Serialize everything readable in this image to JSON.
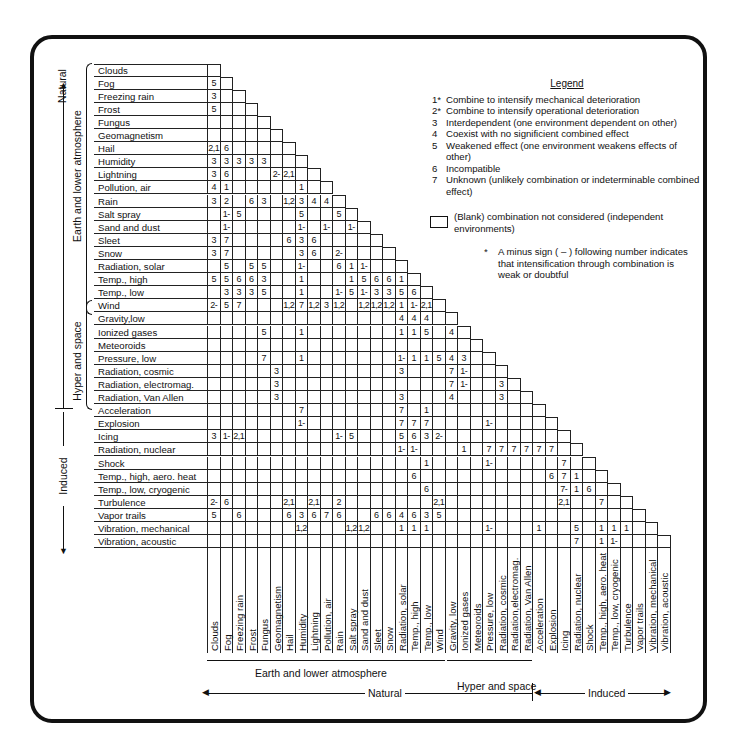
{
  "legend": {
    "title": "Legend",
    "items": [
      {
        "code": "1*",
        "text": "Combine to intensify mechanical deterioration"
      },
      {
        "code": "2*",
        "text": "Combine to intensify operational deterioration"
      },
      {
        "code": "3",
        "text": "Interdependent (one environment dependent on other)"
      },
      {
        "code": "4",
        "text": "Coexist with no significient combined effect"
      },
      {
        "code": "5",
        "text": "Weakened effect (one environment weakens effects of other)"
      },
      {
        "code": "6",
        "text": "Incompatible"
      },
      {
        "code": "7",
        "text": "Unknown (unlikely combination or indeterminable combined effect)"
      }
    ],
    "blank": "(Blank) combination not considered (independent environments)",
    "note_star": "*",
    "note": "A minus sign ( – ) following number indicates that intensification through combination is weak or doubtful"
  },
  "groups": {
    "natural": "Natural",
    "earth": "Earth and lower atmosphere",
    "hyper": "Hyper and space",
    "induced": "Induced"
  },
  "environments": [
    "Clouds",
    "Fog",
    "Freezing rain",
    "Frost",
    "Fungus",
    "Geomagnetism",
    "Hail",
    "Humidity",
    "Lightning",
    "Pollution, air",
    "Rain",
    "Salt spray",
    "Sand and dust",
    "Sleet",
    "Snow",
    "Radiation, solar",
    "Temp., high",
    "Temp., low",
    "Wind",
    "Gravity,low",
    "Ionized gases",
    "Meteoroids",
    "Pressure, low",
    "Radiation, cosmic",
    "Radiation, electromag.",
    "Radiation, Van Allen",
    "Acceleration",
    "Explosion",
    "Icing",
    "Radiation, nuclear",
    "Shock",
    "Temp., high, aero. heat",
    "Temp., low, cryogenic",
    "Turbulence",
    "Vapor trails",
    "Vibration, mechanical",
    "Vibration, acoustic"
  ],
  "column_labels": [
    "Clouds",
    "Fog",
    "Freezing rain",
    "Frost",
    "Fungus",
    "Geomagnetism",
    "Hail",
    "Humidity",
    "Lightning",
    "Pollution, air",
    "Rain",
    "Salt spray",
    "Sand and dust",
    "Sleet",
    "Snow",
    "Radiation, solar",
    "Temp., high",
    "Temp., low",
    "Wind",
    "Gravity, low",
    "Ionized gases",
    "Meteoroids",
    "Pressure, low",
    "Radiation, cosmic",
    "Radiation,electromag.",
    "Radiation, Van Allen",
    "Acceleration",
    "Explosion",
    "Icing",
    "Radiation, nuclear",
    "Shock",
    "Temp., high, aero. heat",
    "Temp., low, cryogenic",
    "Turbulence",
    "Vapor trails",
    "Vibration, mechanical",
    "Vibration, acoustic"
  ],
  "matrix": [
    [],
    [
      "5"
    ],
    [
      "3",
      ""
    ],
    [
      "5",
      "",
      "",
      ""
    ],
    [
      "",
      "",
      "",
      "",
      ""
    ],
    [
      "",
      "",
      "",
      "",
      "",
      ""
    ],
    [
      "2,1",
      "6",
      "",
      "",
      "",
      ""
    ],
    [
      "3",
      "3",
      "3",
      "3",
      "3",
      "",
      ""
    ],
    [
      "3",
      "6",
      "",
      "",
      "",
      "2-",
      "2,1",
      ""
    ],
    [
      "4",
      "1",
      "",
      "",
      "",
      "",
      "",
      "1",
      ""
    ],
    [
      "3",
      "2",
      "",
      "6",
      "3",
      "",
      "1,2",
      "3",
      "4",
      "4"
    ],
    [
      "",
      "1-",
      "5",
      "",
      "",
      "",
      "",
      "5",
      "",
      "",
      "5"
    ],
    [
      "",
      "1-",
      "",
      "",
      "",
      "",
      "",
      "1-",
      "",
      "1-",
      "",
      "1-"
    ],
    [
      "3",
      "7",
      "",
      "",
      "",
      "",
      "6",
      "3",
      "6",
      "",
      "",
      "",
      ""
    ],
    [
      "3",
      "7",
      "",
      "",
      "",
      "",
      "",
      "3",
      "6",
      "",
      "2-",
      "",
      ""
    ],
    [
      "",
      "5",
      "",
      "5",
      "5",
      "",
      "",
      "1-",
      "",
      "",
      "6",
      "1",
      "1-",
      "",
      ""
    ],
    [
      "5",
      "5",
      "6",
      "6",
      "3",
      "",
      "",
      "1",
      "",
      "",
      "",
      "1",
      "5",
      "6",
      "6",
      "1"
    ],
    [
      "",
      "3",
      "3",
      "3",
      "5",
      "",
      "",
      "1",
      "",
      "",
      "1-",
      "5",
      "1-",
      "3",
      "3",
      "5",
      "6"
    ],
    [
      "2-",
      "5",
      "7",
      "",
      "",
      "",
      "1,2",
      "7",
      "1,2",
      "3",
      "1,2",
      "",
      "1,2",
      "1,2",
      "1,2",
      "1",
      "1-",
      "2,1"
    ],
    [
      "",
      "",
      "",
      "",
      "",
      "",
      "",
      "",
      "",
      "",
      "",
      "",
      "",
      "",
      "",
      "4",
      "4",
      "4",
      ""
    ],
    [
      "",
      "",
      "",
      "",
      "5",
      "",
      "",
      "1",
      "",
      "",
      "",
      "",
      "",
      "",
      "",
      "1",
      "1",
      "5",
      "",
      "4"
    ],
    [
      "",
      "",
      "",
      "",
      "",
      "",
      "",
      "",
      "",
      "",
      "",
      "",
      "",
      "",
      "",
      "",
      "",
      "",
      "",
      "",
      ""
    ],
    [
      "",
      "",
      "",
      "",
      "7",
      "",
      "",
      "1",
      "",
      "",
      "",
      "",
      "",
      "",
      "",
      "1-",
      "1",
      "1",
      "5",
      "4",
      "3",
      ""
    ],
    [
      "",
      "",
      "",
      "",
      "",
      "3",
      "",
      "",
      "",
      "",
      "",
      "",
      "",
      "",
      "",
      "3",
      "",
      "",
      "",
      "7",
      "1-",
      "",
      ""
    ],
    [
      "",
      "",
      "",
      "",
      "",
      "3",
      "",
      "",
      "",
      "",
      "",
      "",
      "",
      "",
      "",
      "",
      "",
      "",
      "",
      "7",
      "1-",
      "",
      "",
      "3"
    ],
    [
      "",
      "",
      "",
      "",
      "",
      "3",
      "",
      "",
      "",
      "",
      "",
      "",
      "",
      "",
      "",
      "3",
      "",
      "",
      "",
      "4",
      "",
      "",
      "",
      "3",
      ""
    ],
    [
      "",
      "",
      "",
      "",
      "",
      "",
      "",
      "7",
      "",
      "",
      "",
      "",
      "",
      "",
      "",
      "7",
      "",
      "1",
      "",
      "",
      "",
      "",
      "",
      "",
      "",
      ""
    ],
    [
      "",
      "",
      "",
      "",
      "",
      "",
      "",
      "1-",
      "",
      "",
      "",
      "",
      "",
      "",
      "",
      "7",
      "7",
      "7",
      "",
      "",
      "",
      "",
      "1-",
      "",
      "",
      "",
      ""
    ],
    [
      "3",
      "1-",
      "2,1",
      "",
      "",
      "",
      "",
      "",
      "",
      "",
      "1-",
      "5",
      "",
      "",
      "",
      "5",
      "6",
      "3",
      "2-",
      "",
      "",
      "",
      "",
      "",
      "",
      "",
      "",
      ""
    ],
    [
      "",
      "",
      "",
      "",
      "",
      "",
      "",
      "",
      "",
      "",
      "",
      "",
      "",
      "",
      "",
      "1-",
      "1-",
      "",
      "",
      "",
      "1",
      "",
      "7",
      "7",
      "7",
      "7",
      "7",
      "7",
      ""
    ],
    [
      "",
      "",
      "",
      "",
      "",
      "",
      "",
      "",
      "",
      "",
      "",
      "",
      "",
      "",
      "",
      "",
      "",
      "1",
      "",
      "",
      "",
      "",
      "1-",
      "",
      "",
      "",
      "",
      "",
      "7",
      ""
    ],
    [
      "",
      "",
      "",
      "",
      "",
      "",
      "",
      "",
      "",
      "",
      "",
      "",
      "",
      "",
      "",
      "",
      "6",
      "",
      "",
      "",
      "",
      "",
      "",
      "",
      "",
      "",
      "",
      "6",
      "7",
      "1",
      ""
    ],
    [
      "",
      "",
      "",
      "",
      "",
      "",
      "",
      "",
      "",
      "",
      "",
      "",
      "",
      "",
      "",
      "",
      "",
      "6",
      "",
      "",
      "",
      "",
      "",
      "",
      "",
      "",
      "",
      "",
      "7-",
      "1",
      "6",
      ""
    ],
    [
      "2-",
      "6",
      "",
      "",
      "",
      "",
      "2,1",
      "",
      "2,1",
      "",
      "2",
      "",
      "",
      "",
      "",
      "",
      "",
      "",
      "2,1",
      "",
      "",
      "",
      "",
      "",
      "",
      "",
      "",
      "",
      "2,1",
      "",
      "",
      "7",
      ""
    ],
    [
      "5",
      "",
      "6",
      "",
      "",
      "",
      "6",
      "3",
      "6",
      "7",
      "6",
      "",
      "",
      "6",
      "6",
      "4",
      "6",
      "3",
      "5",
      "",
      "",
      "",
      "",
      "",
      "",
      "",
      "",
      "",
      "",
      "",
      "",
      "",
      "",
      ""
    ],
    [
      "",
      "",
      "",
      "",
      "",
      "",
      "",
      "1,2",
      "",
      "",
      "",
      "1,2",
      "1,2",
      "",
      "",
      "1",
      "1",
      "1",
      "",
      "",
      "",
      "",
      "1-",
      "",
      "",
      "",
      "1",
      "",
      "",
      "5",
      "",
      "1",
      "1",
      "1",
      ""
    ],
    [
      "",
      "",
      "",
      "",
      "",
      "",
      "",
      "",
      "",
      "",
      "",
      "",
      "",
      "",
      "",
      "",
      "",
      "",
      "",
      "",
      "",
      "",
      "",
      "",
      "",
      "",
      "",
      "",
      "",
      "7",
      "",
      "1",
      "1-",
      "",
      "",
      ""
    ]
  ]
}
